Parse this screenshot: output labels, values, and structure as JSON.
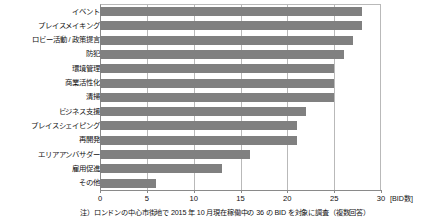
{
  "chart_data": {
    "type": "bar",
    "orientation": "horizontal",
    "title": "",
    "xlabel": "[BID数]",
    "ylabel": "",
    "xlim": [
      0,
      30
    ],
    "xticks": [
      0,
      5,
      10,
      15,
      20,
      25,
      30
    ],
    "grid": true,
    "legend": false,
    "bar_color": "#808080",
    "categories": [
      "イベント",
      "プレイスメイキング",
      "ロビー活動 / 政策提言",
      "防犯",
      "環境管理",
      "商業活性化",
      "清掃",
      "ビジネス支援",
      "プレイスシェイピング",
      "再開発",
      "エリアアンバサダー",
      "雇用促進",
      "その他"
    ],
    "values": [
      28,
      28,
      27,
      26,
      25,
      25,
      25,
      22,
      21,
      21,
      16,
      13,
      6
    ],
    "annotations": [
      "注）ロンドンの中心市街地で 2015 年 10 月現在稼働中の 36 の BID を対象に調査（複数回答）"
    ]
  },
  "footnote": "注）ロンドンの中心市街地で 2015 年 10 月現在稼働中の 36 の BID を対象に調査（複数回答）",
  "axis_unit": "[BID数]"
}
